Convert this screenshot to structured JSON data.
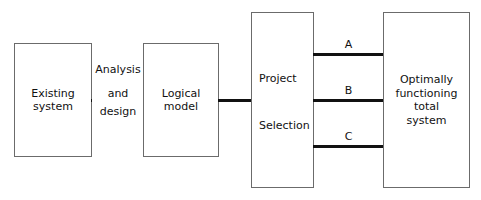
{
  "diagram": {
    "background_color": "#ffffff",
    "box_border_color": "#6b6b6b",
    "connector_color": "#111111",
    "text_color": "#111111"
  },
  "boxes": {
    "existing_system": {
      "line1": "Existing",
      "line2": "system"
    },
    "logical_model": {
      "line1": "Logical",
      "line2": "model"
    },
    "project_selection": {
      "line1": "Project",
      "line2": "Selection"
    },
    "total_system": {
      "line1": "Optimally",
      "line2": "functioning",
      "line3": "total",
      "line4": "system"
    }
  },
  "edge_labels": {
    "analysis_design_top": "Analysis",
    "analysis_design_line2": "and",
    "analysis_design_line3": "design",
    "option_a": "A",
    "option_b": "B",
    "option_c": "C"
  }
}
